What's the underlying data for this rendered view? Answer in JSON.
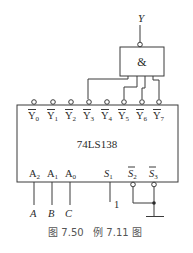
{
  "figure": {
    "caption": "图 7.50   例 7.11 图",
    "output_label": "Y",
    "and_gate": {
      "symbol": "&"
    },
    "chip": {
      "name": "74LS138",
      "outputs": [
        {
          "sub": "0",
          "base": "Y"
        },
        {
          "sub": "1",
          "base": "Y"
        },
        {
          "sub": "2",
          "base": "Y"
        },
        {
          "sub": "3",
          "base": "Y"
        },
        {
          "sub": "4",
          "base": "Y"
        },
        {
          "sub": "5",
          "base": "Y"
        },
        {
          "sub": "6",
          "base": "Y"
        },
        {
          "sub": "7",
          "base": "Y"
        }
      ],
      "inputs": [
        {
          "base": "A",
          "sub": "2"
        },
        {
          "base": "A",
          "sub": "1"
        },
        {
          "base": "A",
          "sub": "0"
        },
        {
          "base": "S",
          "sub": "1"
        },
        {
          "base": "S",
          "sub": "2"
        },
        {
          "base": "S",
          "sub": "3"
        }
      ]
    },
    "input_signals": [
      "A",
      "B",
      "C"
    ],
    "s1_value": "1",
    "connected_outputs": [
      "Y3",
      "Y5",
      "Y6",
      "Y7"
    ]
  }
}
